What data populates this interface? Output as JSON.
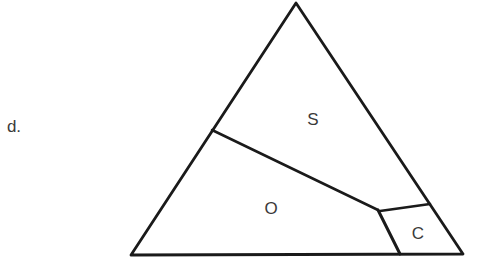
{
  "panel": {
    "label": "d."
  },
  "diagram": {
    "type": "ternary-phase-diagram",
    "stroke_color": "#1a1a1a",
    "triangle": {
      "apex": [
        296,
        3
      ],
      "bottom_left": [
        131,
        255
      ],
      "bottom_right": [
        463,
        254
      ]
    },
    "boundaries": [
      {
        "name": "S-O boundary",
        "points": [
          [
            212,
            130
          ],
          [
            378,
            210
          ]
        ]
      },
      {
        "name": "S-C boundary",
        "points": [
          [
            381,
            211
          ],
          [
            430,
            204
          ]
        ]
      },
      {
        "name": "O-C boundary",
        "points": [
          [
            378,
            210
          ],
          [
            400,
            254
          ]
        ]
      }
    ],
    "regions": [
      {
        "id": "S",
        "label": "S",
        "x": 313,
        "y": 119
      },
      {
        "id": "O",
        "label": "O",
        "x": 271,
        "y": 208
      },
      {
        "id": "C",
        "label": "C",
        "x": 418,
        "y": 233
      }
    ]
  }
}
